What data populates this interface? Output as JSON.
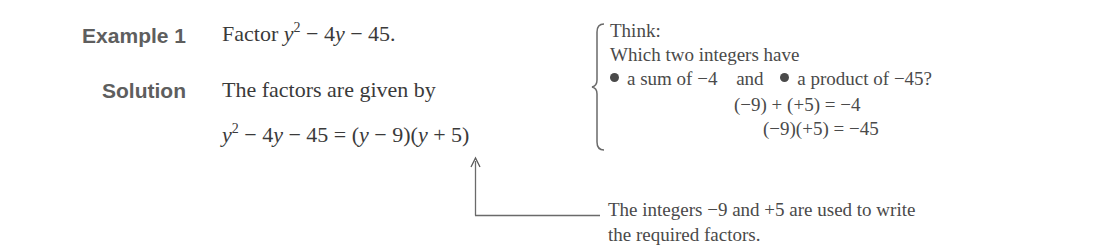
{
  "example": {
    "label": "Example 1",
    "prompt_word": "Factor",
    "expression": {
      "var": "y",
      "exp": "2",
      "rest": " − 4",
      "var2": "y",
      "rest2": " − 45."
    }
  },
  "solution": {
    "label": "Solution",
    "intro": "The factors are given by",
    "equation": {
      "lhs_var": "y",
      "lhs_exp": "2",
      "lhs_mid": " − 4",
      "lhs_var2": "y",
      "lhs_end": " − 45 = (",
      "f1_var": "y",
      "f1_rest": " − 9)(",
      "f2_var": "y",
      "f2_rest": " + 5)"
    }
  },
  "think_box": {
    "heading": "Think:",
    "question": "Which two integers have",
    "bullet1": "a sum of −4",
    "connector": "and",
    "bullet2": "a product of −45?",
    "check_sum": "(−9) + (+5) = −4",
    "check_product": "(−9)(+5) = −45"
  },
  "annotation": {
    "line1": "The integers −9 and +5 are used to write",
    "line2": "the required factors."
  }
}
